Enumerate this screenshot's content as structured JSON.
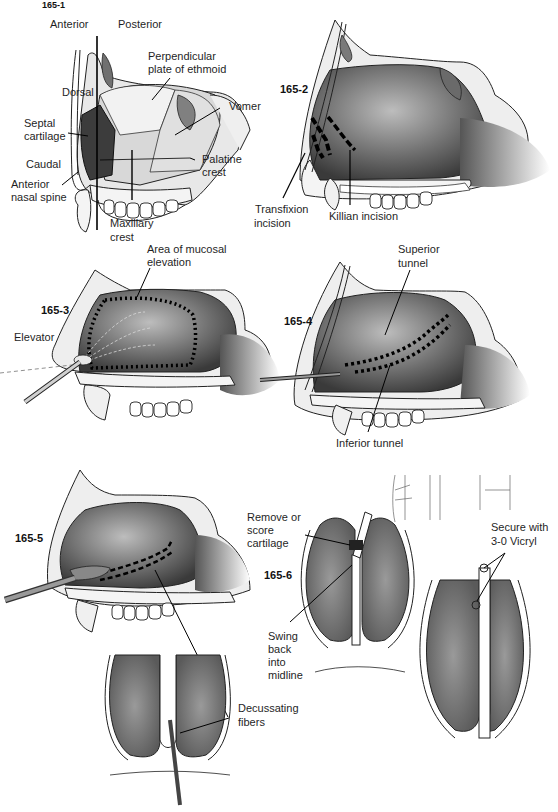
{
  "figures": {
    "f1": {
      "number": "165-1",
      "labels": {
        "anterior": "Anterior",
        "posterior": "Posterior",
        "perpendicular_plate_1": "Perpendicular",
        "perpendicular_plate_2": "plate of ethmoid",
        "dorsal": "Dorsal",
        "septal_cartilage_1": "Septal",
        "septal_cartilage_2": "cartilage",
        "vomer": "Vomer",
        "caudal": "Caudal",
        "palatine_crest_1": "Palatine",
        "palatine_crest_2": "crest",
        "anterior_nasal_spine_1": "Anterior",
        "anterior_nasal_spine_2": "nasal spine",
        "maxillary_crest_1": "Maxillary",
        "maxillary_crest_2": "crest"
      }
    },
    "f2": {
      "number": "165-2",
      "labels": {
        "transfixion_1": "Transfixion",
        "transfixion_2": "incision",
        "killian": "Killian incision"
      }
    },
    "f3": {
      "number": "165-3",
      "labels": {
        "mucosal_1": "Area of mucosal",
        "mucosal_2": "elevation",
        "elevator": "Elevator"
      }
    },
    "f4": {
      "number": "165-4",
      "labels": {
        "superior_1": "Superior",
        "superior_2": "tunnel",
        "inferior": "Inferior tunnel"
      }
    },
    "f5": {
      "number": "165-5",
      "labels": {
        "decussating_1": "Decussating",
        "decussating_2": "fibers"
      }
    },
    "f6": {
      "number": "165-6",
      "labels": {
        "remove_1": "Remove or",
        "remove_2": "score",
        "remove_3": "cartilage",
        "swing_1": "Swing",
        "swing_2": "back",
        "swing_3": "into",
        "swing_4": "midline",
        "secure_1": "Secure with",
        "secure_2": "3-0 Vicryl"
      }
    }
  }
}
